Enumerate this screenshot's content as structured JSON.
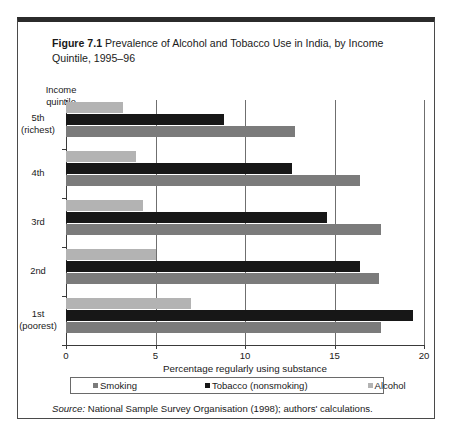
{
  "figure": {
    "number": "Figure 7.1",
    "title": "Prevalence of Alcohol and Tobacco Use in India, by Income Quintile, 1995–96",
    "source_label": "Source:",
    "source_text": " National Sample Survey Organisation (1998); authors' calculations."
  },
  "chart_data": {
    "type": "bar",
    "orientation": "horizontal",
    "title": "Prevalence of Alcohol and Tobacco Use in India, by Income Quintile, 1995–96",
    "xlabel": "Percentage regularly using substance",
    "ylabel": "Income quintile",
    "xlim": [
      0,
      20
    ],
    "xticks": [
      "0",
      "5",
      "10",
      "15",
      "20"
    ],
    "grid": true,
    "legend_position": "bottom",
    "categories": [
      "5th (richest)",
      "4th",
      "3rd",
      "2nd",
      "1st (poorest)"
    ],
    "category_lines": [
      [
        "5th",
        "(richest)"
      ],
      [
        "4th"
      ],
      [
        "3rd"
      ],
      [
        "2nd"
      ],
      [
        "1st",
        "(poorest)"
      ]
    ],
    "series": [
      {
        "name": "Alcohol",
        "color": "#b3b3b3",
        "key": "alcohol",
        "values": [
          3.2,
          3.9,
          4.3,
          5.0,
          7.0
        ]
      },
      {
        "name": "Tobacco (nonsmoking)",
        "color": "#171717",
        "key": "tobacco",
        "values": [
          8.8,
          12.6,
          14.6,
          16.4,
          19.4
        ]
      },
      {
        "name": "Smoking",
        "color": "#7b7b7b",
        "key": "smoking",
        "values": [
          12.8,
          16.4,
          17.6,
          17.5,
          17.6
        ]
      }
    ],
    "legend_order": [
      "Smoking",
      "Tobacco (nonsmoking)",
      "Alcohol"
    ]
  }
}
